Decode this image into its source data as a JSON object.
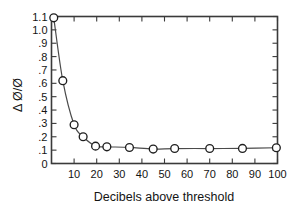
{
  "chart_data": {
    "type": "line",
    "title": "",
    "subtitle": "",
    "xlabel": "Decibels above threshold",
    "ylabel": "Δ Ø/Ø",
    "xlim": [
      0,
      100
    ],
    "ylim": [
      0,
      1.1
    ],
    "grid": false,
    "legend": null,
    "markers": "open-circle",
    "x_tick_labels": [
      "10",
      "20",
      "30",
      "40",
      "50",
      "60",
      "70",
      "80",
      "90",
      "100"
    ],
    "x_tick_values": [
      10,
      20,
      30,
      40,
      50,
      60,
      70,
      80,
      90,
      100
    ],
    "y_tick_labels": [
      "0",
      ".1",
      ".2",
      ".3",
      ".4",
      ".5",
      ".6",
      ".7",
      ".8",
      ".9",
      "1.0",
      "1.1"
    ],
    "y_tick_values": [
      0,
      0.1,
      0.2,
      0.3,
      0.4,
      0.5,
      0.6,
      0.7,
      0.8,
      0.9,
      1.0,
      1.1
    ],
    "x": [
      1,
      5,
      10,
      14,
      19.5,
      24.5,
      34.5,
      45,
      54.5,
      70,
      84.5,
      99.5
    ],
    "values": [
      1.09,
      0.62,
      0.29,
      0.2,
      0.13,
      0.125,
      0.12,
      0.108,
      0.112,
      0.112,
      0.113,
      0.118
    ],
    "series": [
      {
        "name": "",
        "x": [
          1,
          5,
          10,
          14,
          19.5,
          24.5,
          34.5,
          45,
          54.5,
          70,
          84.5,
          99.5
        ],
        "values": [
          1.09,
          0.62,
          0.29,
          0.2,
          0.13,
          0.125,
          0.12,
          0.108,
          0.112,
          0.112,
          0.113,
          0.118
        ]
      }
    ],
    "colors": {
      "line": "#4a4a4a",
      "marker_fill": "#ffffff",
      "marker_stroke": "#1f1f1f",
      "axis": "#3a3a3a",
      "text": "#141414",
      "background": "#ffffff"
    }
  }
}
